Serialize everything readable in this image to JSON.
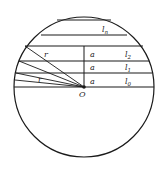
{
  "caption": "",
  "diagram": {
    "center": {
      "label": "O",
      "x": 84,
      "y": 87
    },
    "radius": 70,
    "chords": [
      {
        "y": 20,
        "label": ""
      },
      {
        "y": 35,
        "label": "l",
        "subscript": "n"
      },
      {
        "y": 46,
        "label": ""
      },
      {
        "y": 61,
        "label": "l",
        "subscript": "2"
      },
      {
        "y": 73,
        "label": "l",
        "subscript": "1"
      },
      {
        "y": 87,
        "label": "l",
        "subscript": "0"
      }
    ],
    "spacing_labels": [
      "a",
      "a",
      "a"
    ],
    "radius_labels": [
      "r",
      "r"
    ],
    "colors": {
      "stroke": "#1a1a1a",
      "text": "#222222"
    }
  }
}
